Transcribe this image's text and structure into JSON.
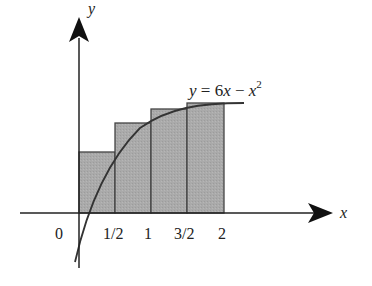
{
  "diagram": {
    "type": "riemann-sum-upper-rectangles",
    "function_label": {
      "prefix": "y = 6x − x",
      "exponent": "2"
    },
    "axes": {
      "x_label": "x",
      "y_label": "y",
      "origin_label": "0",
      "x_ticks": [
        "1/2",
        "1",
        "3/2",
        "2"
      ]
    },
    "rectangles": [
      {
        "x_start": 0,
        "x_end": 0.5
      },
      {
        "x_start": 0.5,
        "x_end": 1
      },
      {
        "x_start": 1,
        "x_end": 1.5
      },
      {
        "x_start": 1.5,
        "x_end": 2
      }
    ],
    "colors": {
      "rect_fill": "#a9a9a9",
      "rect_stroke": "#444444",
      "axis": "#222222",
      "curve": "#333333"
    }
  }
}
